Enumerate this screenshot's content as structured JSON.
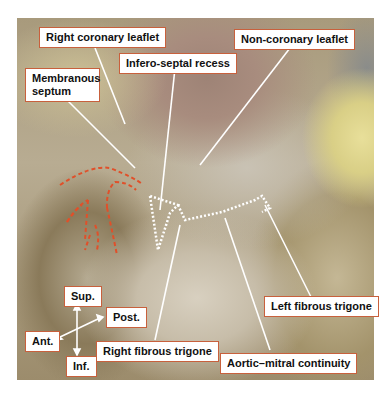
{
  "figure": {
    "labels": {
      "right_coronary_leaflet": "Right coronary leaflet",
      "non_coronary_leaflet": "Non-coronary leaflet",
      "infero_septal_recess": "Infero-septal recess",
      "membranous_septum": "Membranous septum",
      "left_fibrous_trigone": "Left fibrous trigone",
      "right_fibrous_trigone": "Right fibrous trigone",
      "aortic_mitral_continuity": "Aortic–mitral continuity"
    },
    "orientation": {
      "sup": "Sup.",
      "inf": "Inf.",
      "ant": "Ant.",
      "post": "Post."
    },
    "colors": {
      "label_border": "#c8603c",
      "leader_line": "#ffffff",
      "dotted_outline": "#ffffff",
      "red_dashes": "#e0502a"
    }
  }
}
